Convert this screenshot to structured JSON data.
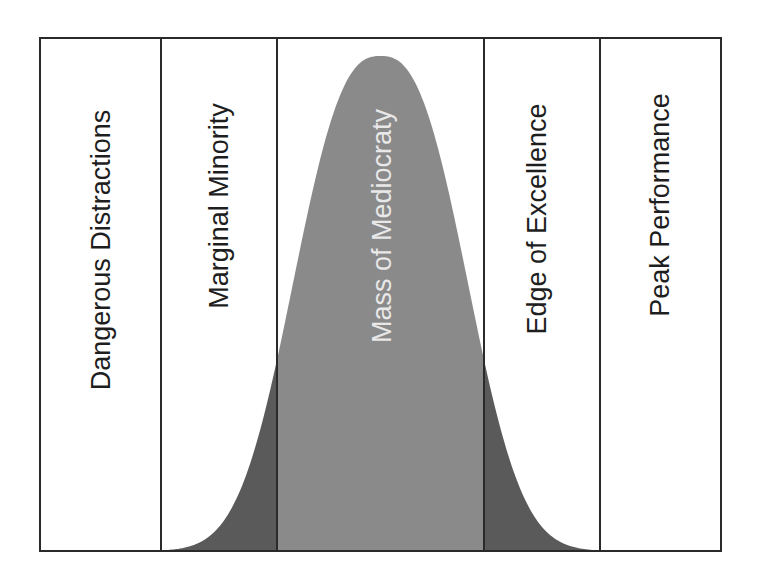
{
  "diagram": {
    "type": "bell-curve-segmented",
    "colors": {
      "frame": "#2a2a2a",
      "background": "#ffffff",
      "tail_light": "#c4c4c4",
      "band_dark": "#5a5a5a",
      "center": "#8a8a8a",
      "center_text": "#e8e8e8",
      "text": "#1e1e1e"
    },
    "segments": [
      {
        "label": "Dangerous Distractions"
      },
      {
        "label": "Marginal Minority"
      },
      {
        "label": "Mass of Mediocraty"
      },
      {
        "label": "Edge of Excellence"
      },
      {
        "label": "Peak Performance"
      }
    ]
  }
}
